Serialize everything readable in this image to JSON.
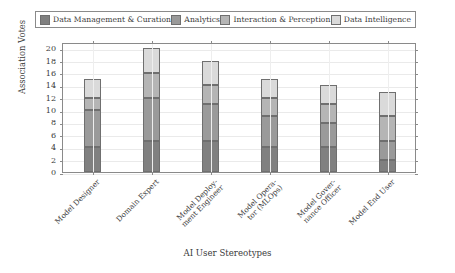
{
  "chart_data": {
    "type": "bar",
    "stacked": true,
    "title": "",
    "xlabel": "AI User Stereotypes",
    "ylabel": "Association Votes",
    "ylim": [
      0,
      21
    ],
    "yticks": [
      0,
      2,
      4,
      6,
      8,
      10,
      12,
      14,
      16,
      18,
      20
    ],
    "grid": true,
    "legend_position": "top",
    "categories": [
      "Model Designer",
      "Domain Expert",
      "Model Deploy-\nment Engineer",
      "Model Opera-\ntor (MLOps)",
      "Model Gover-\nnance Officer",
      "Model End User"
    ],
    "series": [
      {
        "name": "Data Management & Curation",
        "color": "#808080",
        "values": [
          4,
          5,
          5,
          4,
          4,
          2
        ]
      },
      {
        "name": "Analytics",
        "color": "#9a9a9a",
        "values": [
          6,
          7,
          6,
          5,
          4,
          3
        ]
      },
      {
        "name": "Interaction & Perception",
        "color": "#b5b5b5",
        "values": [
          2,
          4,
          3,
          3,
          3,
          4
        ]
      },
      {
        "name": "Data Intelligence",
        "color": "#dadada",
        "values": [
          3,
          4,
          4,
          3,
          3,
          4
        ]
      }
    ],
    "totals": [
      15,
      20,
      18,
      15,
      14,
      13
    ]
  },
  "axis": {
    "ytick_labels": [
      "0",
      "2",
      "4",
      "6",
      "8",
      "10",
      "12",
      "14",
      "16",
      "18",
      "20"
    ],
    "y_title": "Association Votes",
    "x_title": "AI User Stereotypes"
  },
  "legend": {
    "entries": [
      {
        "label": "Data Management & Curation",
        "color": "#808080"
      },
      {
        "label": "Analytics",
        "color": "#9a9a9a"
      },
      {
        "label": "Interaction & Perception",
        "color": "#b5b5b5"
      },
      {
        "label": "Data Intelligence",
        "color": "#dadada"
      }
    ]
  }
}
